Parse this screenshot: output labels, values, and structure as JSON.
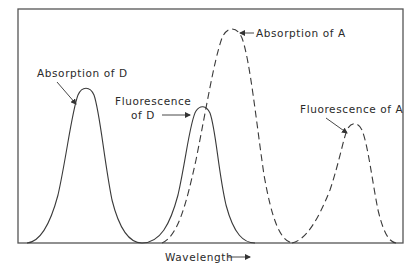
{
  "figure": {
    "type": "spectral-overlap-diagram",
    "x_axis_label": "Wavelength",
    "x_axis_arrow": "→",
    "labels": {
      "absorption_d": "Absorption of D",
      "fluorescence_d_line1": "Fluorescence",
      "fluorescence_d_line2": "of D",
      "absorption_a": "Absorption of A",
      "fluorescence_a": "Fluorescence of A"
    },
    "curves": [
      {
        "name": "Absorption of D",
        "style": "solid",
        "peak_x": 86,
        "peak_y": 88
      },
      {
        "name": "Fluorescence of D",
        "style": "solid",
        "peak_x": 202,
        "peak_y": 108
      },
      {
        "name": "Absorption of A",
        "style": "dashed",
        "peak_x": 232,
        "peak_y": 29
      },
      {
        "name": "Fluorescence of A",
        "style": "dashed",
        "peak_x": 354,
        "peak_y": 125
      }
    ],
    "colors": {
      "line": "#3a3a3a",
      "frame": "#555555",
      "background": "#ffffff"
    }
  }
}
